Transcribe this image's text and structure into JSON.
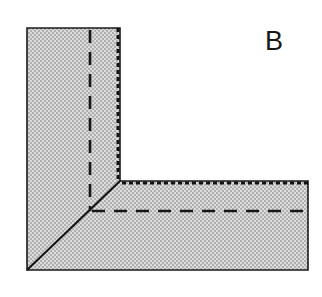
{
  "figure": {
    "panel_label": "B",
    "background_color": "#ffffff",
    "fill_color": "#c9c9c9",
    "fill_pattern": "checkerboard-dither",
    "stroke_color": "#1a1a1a",
    "canvas": {
      "width": 322,
      "height": 297
    }
  },
  "shape": {
    "name": "L-shaped-region",
    "description": "Gray L-shaped (elbow) region with mitred 45 degree corner joint",
    "outline_points": "27,28 120,28 120,181 308,181 308,270 27,270",
    "bounds": {
      "left": 27,
      "top": 28,
      "right": 308,
      "bottom": 270
    },
    "vertical_arm": {
      "left": 27,
      "right": 120,
      "top": 28,
      "bottom": 270
    },
    "horizontal_arm": {
      "left": 27,
      "right": 308,
      "top": 181,
      "bottom": 270
    }
  },
  "lines": {
    "miter_diagonal": {
      "label": "miter-joint-diagonal",
      "style": "solid",
      "from": {
        "x": 120,
        "y": 181
      },
      "to": {
        "x": 27,
        "y": 270
      }
    },
    "vertical_dotted_edge": {
      "label": "vertical-dotted-seam",
      "style": "dotted",
      "x": 118,
      "from_y": 28,
      "to_y": 181
    },
    "vertical_dashed_inner": {
      "label": "vertical-dashed-seam",
      "style": "dashed",
      "x": 90,
      "from_y": 30,
      "to_y": 211
    },
    "horizontal_dotted_edge": {
      "label": "horizontal-dotted-seam",
      "style": "dotted",
      "y": 183,
      "from_x": 122,
      "to_x": 308
    },
    "horizontal_dashed_inner": {
      "label": "horizontal-dashed-seam",
      "style": "dashed",
      "y": 211,
      "from_x": 92,
      "to_x": 306
    }
  }
}
